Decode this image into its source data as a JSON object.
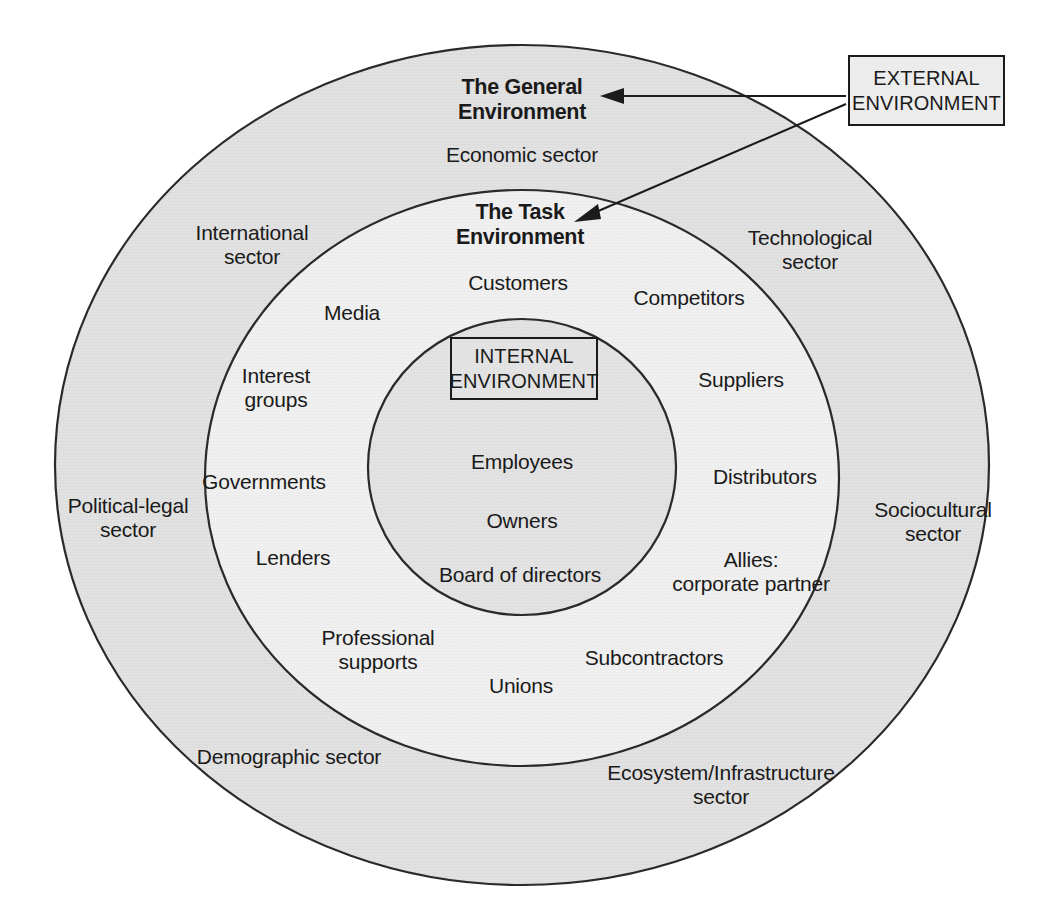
{
  "diagram": {
    "type": "concentric-circles",
    "colors": {
      "outer_ring_fill": "#e1e1e1",
      "middle_ring_fill": "#efefef",
      "inner_circle_fill": "#e2e2e2",
      "stroke": "#1b1b1b",
      "text": "#1a1a1a",
      "page_background": "#ffffff"
    },
    "callouts": {
      "external": {
        "label": "EXTERNAL\nENVIRONMENT",
        "points_to": [
          "The General Environment",
          "The Task Environment"
        ]
      },
      "internal": {
        "label": "INTERNAL\nENVIRONMENT"
      }
    },
    "rings": [
      {
        "id": "general-environment",
        "heading": "The General\nEnvironment",
        "items": [
          "Economic sector",
          "International\nsector",
          "Technological\nsector",
          "Political-legal\nsector",
          "Sociocultural\nsector",
          "Demographic sector",
          "Ecosystem/Infrastructure\nsector"
        ]
      },
      {
        "id": "task-environment",
        "heading": "The Task\nEnvironment",
        "items": [
          "Customers",
          "Media",
          "Competitors",
          "Interest\ngroups",
          "Suppliers",
          "Governments",
          "Distributors",
          "Lenders",
          "Allies:\ncorporate partner",
          "Professional\nsupports",
          "Subcontractors",
          "Unions"
        ]
      },
      {
        "id": "internal-environment",
        "heading": "INTERNAL\nENVIRONMENT",
        "items": [
          "Employees",
          "Owners",
          "Board of directors"
        ]
      }
    ]
  }
}
